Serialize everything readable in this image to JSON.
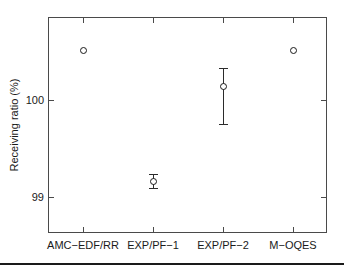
{
  "chart_data": {
    "type": "scatter",
    "title": "",
    "xlabel": "",
    "ylabel": "Receiving ratio (%)",
    "categories": [
      "AMC−EDF/RR",
      "EXP/PF−1",
      "EXP/PF−2",
      "M−OQES"
    ],
    "values": [
      100.0,
      99.0,
      99.73,
      100.0
    ],
    "errors_low": [
      100.0,
      98.95,
      99.44,
      100.0
    ],
    "errors_high": [
      100.0,
      99.06,
      99.87,
      100.0
    ],
    "ylim": [
      98.6,
      100.25
    ],
    "yticks": [
      99,
      100
    ],
    "ytick_labels": [
      "99",
      "100"
    ],
    "xtick_labels": [
      "AMC−EDF/RR",
      "EXP/PF−1",
      "EXP/PF−2",
      "M−OQES"
    ],
    "grid": false,
    "legend": null,
    "marker": "open-circle",
    "series": [
      {
        "name": "Receiving ratio",
        "points": [
          {
            "category": "AMC−EDF/RR",
            "value": 100.0,
            "err_low": 100.0,
            "err_high": 100.0,
            "has_error_bar": false
          },
          {
            "category": "EXP/PF−1",
            "value": 99.0,
            "err_low": 98.95,
            "err_high": 99.06,
            "has_error_bar": true
          },
          {
            "category": "EXP/PF−2",
            "value": 99.73,
            "err_low": 99.44,
            "err_high": 99.87,
            "has_error_bar": true
          },
          {
            "category": "M−OQES",
            "value": 100.0,
            "err_low": 100.0,
            "err_high": 100.0,
            "has_error_bar": false
          }
        ]
      }
    ],
    "colors": {
      "marker": "#1a1a1a",
      "error_bar": "#2b2b2b",
      "axis": "#4a4a4a",
      "background": "#ffffff",
      "text": "#1a1a1a"
    }
  },
  "axis": {
    "ytick_0": "99",
    "ytick_1": "100",
    "ylabel": "Receiving ratio (%)",
    "xtick_0": "AMC−EDF/RR",
    "xtick_1": "EXP/PF−1",
    "xtick_2": "EXP/PF−2",
    "xtick_3": "M−OQES"
  }
}
